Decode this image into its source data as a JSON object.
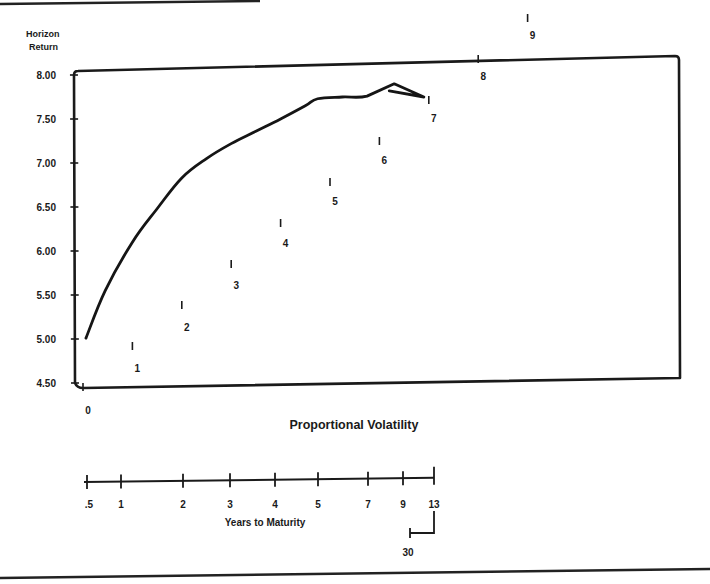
{
  "chart_data": {
    "type": "line",
    "title": "",
    "ylabel": "Horizon Return",
    "ylabel_lines": [
      "Horizon",
      "Return"
    ],
    "xlabel": "Proportional Volatility",
    "secondary_xlabel": "Years to Maturity",
    "ylim": [
      4.5,
      8.0
    ],
    "xlim": [
      0,
      12
    ],
    "grid": false,
    "legend": null,
    "y_ticks": [
      "8.00",
      "7.50",
      "7.00",
      "6.50",
      "6.00",
      "5.50",
      "5.00",
      "4.50"
    ],
    "y_tick_values": [
      8.0,
      7.5,
      7.0,
      6.5,
      6.0,
      5.5,
      5.0,
      4.5
    ],
    "x_ticks": [
      "0",
      "1",
      "2",
      "3",
      "4",
      "5",
      "6",
      "7",
      "8",
      "9",
      "10",
      "11",
      "12"
    ],
    "x_tick_values": [
      0,
      1,
      2,
      3,
      4,
      5,
      6,
      7,
      8,
      9,
      10,
      11,
      12
    ],
    "maturity_scale": {
      "labels": [
        ".5",
        "1",
        "2",
        "3",
        "4",
        "5",
        "7",
        "9",
        "13",
        "30"
      ],
      "volatility_positions": [
        0.05,
        0.7,
        1.95,
        2.95,
        3.9,
        4.8,
        5.85,
        6.5,
        7.0,
        6.3
      ],
      "note": "30-year point folds back below the 13-year tick via a bracket"
    },
    "series": [
      {
        "name": "Horizon Return vs Proportional Volatility",
        "x": [
          0.06,
          0.45,
          1.0,
          1.5,
          2.0,
          2.5,
          3.0,
          3.5,
          4.0,
          4.5,
          4.75,
          5.25,
          5.75,
          6.3,
          6.9,
          6.2
        ],
        "y": [
          5.01,
          5.55,
          6.1,
          6.48,
          6.83,
          7.05,
          7.22,
          7.36,
          7.5,
          7.65,
          7.73,
          7.75,
          7.76,
          7.9,
          7.75,
          7.82
        ]
      }
    ]
  }
}
